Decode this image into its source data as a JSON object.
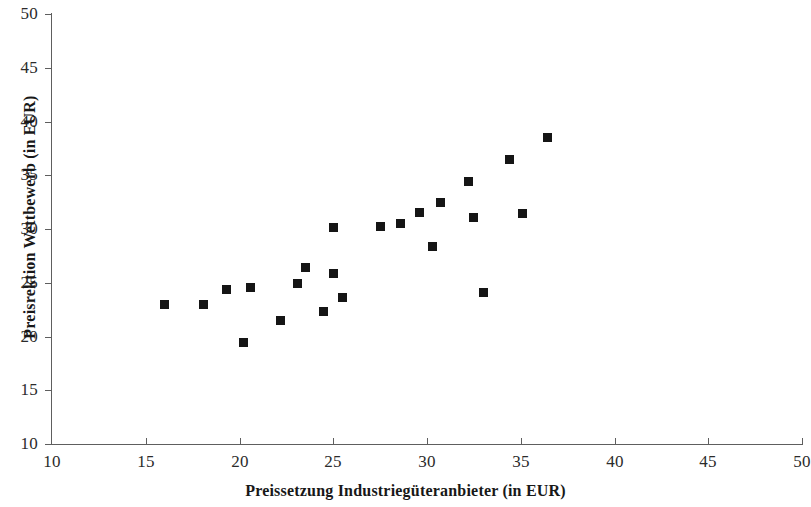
{
  "chart_data": {
    "type": "scatter",
    "title": "",
    "xlabel": "Preissetzung Industriegüteranbieter (in EUR)",
    "ylabel": "Preisrektion Wettbewerb (in EUR)",
    "xlim": [
      10,
      50
    ],
    "ylim": [
      10,
      50
    ],
    "xticks": [
      10,
      15,
      20,
      25,
      30,
      35,
      40,
      45,
      50
    ],
    "yticks": [
      10,
      15,
      20,
      25,
      30,
      35,
      40,
      45,
      50
    ],
    "xtick_labels": [
      "10",
      "15",
      "20",
      "25",
      "30",
      "35",
      "40",
      "45",
      "50"
    ],
    "ytick_labels": [
      "10",
      "15",
      "20",
      "25",
      "30",
      "35",
      "40",
      "45",
      "50"
    ],
    "grid": false,
    "legend": null,
    "marker": "square",
    "marker_color": "#151515",
    "marker_size_px": 9,
    "axis_color": "#5e5e5e",
    "background_color": "#ffffff",
    "points": [
      {
        "x": 16.0,
        "y": 23.0
      },
      {
        "x": 18.1,
        "y": 23.0
      },
      {
        "x": 19.3,
        "y": 24.4
      },
      {
        "x": 20.2,
        "y": 19.4
      },
      {
        "x": 20.6,
        "y": 24.6
      },
      {
        "x": 22.2,
        "y": 21.5
      },
      {
        "x": 23.1,
        "y": 24.9
      },
      {
        "x": 23.5,
        "y": 26.4
      },
      {
        "x": 24.5,
        "y": 22.3
      },
      {
        "x": 25.0,
        "y": 30.1
      },
      {
        "x": 25.0,
        "y": 25.9
      },
      {
        "x": 25.5,
        "y": 23.6
      },
      {
        "x": 27.5,
        "y": 30.2
      },
      {
        "x": 28.6,
        "y": 30.5
      },
      {
        "x": 29.6,
        "y": 31.5
      },
      {
        "x": 30.3,
        "y": 28.4
      },
      {
        "x": 30.7,
        "y": 32.5
      },
      {
        "x": 32.2,
        "y": 34.4
      },
      {
        "x": 32.5,
        "y": 31.1
      },
      {
        "x": 33.0,
        "y": 24.1
      },
      {
        "x": 34.4,
        "y": 36.5
      },
      {
        "x": 35.1,
        "y": 31.4
      },
      {
        "x": 36.4,
        "y": 38.5
      }
    ]
  }
}
